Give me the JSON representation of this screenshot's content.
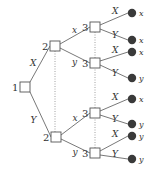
{
  "colors": {
    "line": "#555555",
    "node_fill": "#ffffff",
    "terminal_fill": "#3a3a3a",
    "dotted": "#888888"
  },
  "nodes": [
    {
      "id": "n1",
      "player": "1",
      "x": 25,
      "y": 87
    },
    {
      "id": "n2a",
      "player": "2",
      "x": 55,
      "y": 46
    },
    {
      "id": "n2b",
      "player": "2",
      "x": 56,
      "y": 137
    },
    {
      "id": "n3a",
      "player": "3",
      "x": 95,
      "y": 27
    },
    {
      "id": "n3b",
      "player": "3",
      "x": 95,
      "y": 63
    },
    {
      "id": "n3c",
      "player": "3",
      "x": 95,
      "y": 113
    },
    {
      "id": "n3d",
      "player": "3",
      "x": 95,
      "y": 153
    }
  ],
  "edges": [
    {
      "from": "n1",
      "to": "n2a",
      "label": "X"
    },
    {
      "from": "n1",
      "to": "n2b",
      "label": "Y"
    },
    {
      "from": "n2a",
      "to": "n3a",
      "label": "x"
    },
    {
      "from": "n2a",
      "to": "n3b",
      "label": "y"
    },
    {
      "from": "n2b",
      "to": "n3c",
      "label": "x"
    },
    {
      "from": "n2b",
      "to": "n3d",
      "label": "y"
    }
  ],
  "terminals": [
    {
      "from": "n3a",
      "action": "X",
      "outcome": "x",
      "x": 132,
      "y": 13
    },
    {
      "from": "n3a",
      "action": "Y",
      "outcome": "x",
      "x": 132,
      "y": 40
    },
    {
      "from": "n3b",
      "action": "X",
      "outcome": "x",
      "x": 132,
      "y": 52
    },
    {
      "from": "n3b",
      "action": "Y",
      "outcome": "y",
      "x": 132,
      "y": 78
    },
    {
      "from": "n3c",
      "action": "X",
      "outcome": "x",
      "x": 132,
      "y": 99
    },
    {
      "from": "n3c",
      "action": "Y",
      "outcome": "y",
      "x": 132,
      "y": 124
    },
    {
      "from": "n3d",
      "action": "X",
      "outcome": "y",
      "x": 132,
      "y": 136
    },
    {
      "from": "n3d",
      "action": "Y",
      "outcome": "y",
      "x": 132,
      "y": 159
    }
  ],
  "information_sets": [
    {
      "player": "2",
      "nodes": [
        "n2a",
        "n2b"
      ]
    },
    {
      "player": "3",
      "nodes": [
        "n3a",
        "n3b",
        "n3c",
        "n3d"
      ]
    }
  ]
}
